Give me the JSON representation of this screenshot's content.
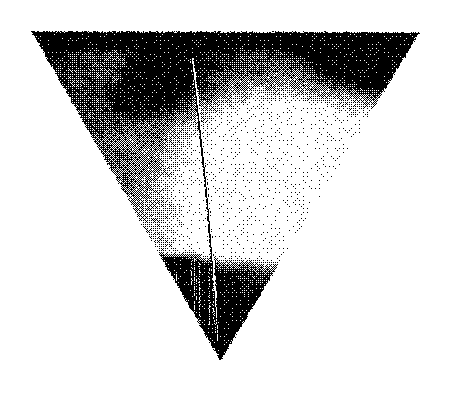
{
  "image": {
    "kind": "halftone-scan",
    "title": "Inverted triangular object, high-contrast halftone scan",
    "description": "Black-and-white dithered photographic reproduction of a downward-pointing triangular form on a plain white field",
    "width": 451,
    "height": 395,
    "background_color": "#ffffff",
    "ink_color": "#000000",
    "has_text": false,
    "has_axes": false,
    "has_legend": false
  },
  "geometry": {
    "shape": "inverted-triangle",
    "vertices": [
      {
        "name": "top-left",
        "x": 31,
        "y": 31
      },
      {
        "name": "top-right",
        "x": 419,
        "y": 32
      },
      {
        "name": "bottom-apex",
        "x": 220,
        "y": 360
      }
    ],
    "top_edge_y": 31,
    "apex_y": 360
  },
  "regions": [
    {
      "name": "top-dark-band",
      "tone": "black",
      "x": 31,
      "y": 31,
      "width": 388,
      "height": 22,
      "note": "Solid dark strip along the upper edge"
    },
    {
      "name": "upper-right-dark-corner",
      "tone": "black",
      "x": 300,
      "y": 31,
      "width": 119,
      "height": 75,
      "note": "Dense black wedge at the right corner"
    },
    {
      "name": "upper-left-mottled-highlight",
      "tone": "mid-light",
      "x": 58,
      "y": 38,
      "width": 120,
      "height": 60,
      "note": "Broken mottled bright speckle patch"
    },
    {
      "name": "upper-left-dark-blob",
      "tone": "black",
      "x": 120,
      "y": 52,
      "width": 75,
      "height": 60,
      "note": "Rounded dark mass left of the vertical line"
    },
    {
      "name": "left-grain-field",
      "tone": "mid-dark",
      "x": 40,
      "y": 95,
      "width": 150,
      "height": 165,
      "note": "Coarse 50 percent dither covering the left flank"
    },
    {
      "name": "central-bright-core",
      "tone": "white",
      "x": 228,
      "y": 148,
      "width": 86,
      "height": 70,
      "note": "Brightest area, nearly clear of dots"
    },
    {
      "name": "right-gradient-field",
      "tone": "light",
      "x": 215,
      "y": 60,
      "width": 175,
      "height": 190,
      "note": "Dot density fades from dark at top to clear at centre"
    },
    {
      "name": "bottom-dark-band",
      "tone": "black",
      "x": 150,
      "y": 253,
      "width": 175,
      "height": 50,
      "note": "Heavy dark band crossing the lower triangle"
    },
    {
      "name": "bottom-left-solid-wedge",
      "tone": "black",
      "x": 150,
      "y": 255,
      "width": 75,
      "height": 80,
      "note": "Solid black wedge above the apex"
    },
    {
      "name": "apex-solid",
      "tone": "black",
      "x": 185,
      "y": 300,
      "width": 72,
      "height": 60,
      "note": "Fully inked point of the triangle"
    }
  ],
  "features": [
    {
      "name": "vertical-filament",
      "type": "thin-dark-line",
      "start_x": 190,
      "start_y": 52,
      "end_x": 216,
      "end_y": 332,
      "thickness_px": 2,
      "note": "Slender wire-like stroke with a small hook at its top, running almost vertically to the apex region"
    },
    {
      "name": "filament-highlight",
      "type": "thin-light-line",
      "start_x": 194,
      "start_y": 58,
      "end_x": 220,
      "end_y": 330,
      "thickness_px": 2,
      "note": "Pale edge following the right side of the filament"
    }
  ],
  "render": {
    "dither_cell": 1,
    "noise_seed": 20240517,
    "edge_roughness_px": 2
  }
}
